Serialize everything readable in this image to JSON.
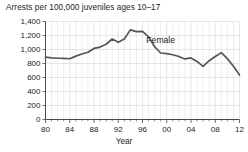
{
  "chart_data": {
    "type": "line",
    "title": "Arrests per 100,000 juveniles ages 10–17",
    "xlabel": "Year",
    "ylabel": "",
    "xlim": [
      1980,
      2012
    ],
    "ylim": [
      0,
      1400
    ],
    "grid": true,
    "legend_position": "inline-annotation",
    "y_ticks": [
      0,
      200,
      400,
      600,
      800,
      1000,
      1200,
      1400
    ],
    "y_tick_labels": [
      "0",
      "200",
      "400",
      "600",
      "800",
      "1,000",
      "1,200",
      "1,400"
    ],
    "x_ticks": [
      1980,
      1984,
      1988,
      1992,
      1996,
      2000,
      2004,
      2008,
      2012
    ],
    "x_tick_labels": [
      "80",
      "84",
      "88",
      "92",
      "96",
      "00",
      "04",
      "08",
      "12"
    ],
    "annotations": [
      {
        "text": "Female",
        "x": 1999,
        "y": 1090
      }
    ],
    "series": [
      {
        "name": "Female",
        "color": "#555555",
        "x": [
          1980,
          1981,
          1982,
          1983,
          1984,
          1985,
          1986,
          1987,
          1988,
          1989,
          1990,
          1991,
          1992,
          1993,
          1994,
          1995,
          1996,
          1997,
          1998,
          1999,
          2000,
          2001,
          2002,
          2003,
          2004,
          2005,
          2006,
          2007,
          2008,
          2009,
          2010,
          2011,
          2012
        ],
        "values": [
          890,
          880,
          875,
          872,
          868,
          905,
          935,
          960,
          1015,
          1035,
          1075,
          1150,
          1105,
          1150,
          1280,
          1255,
          1258,
          1180,
          1040,
          950,
          940,
          925,
          900,
          865,
          880,
          830,
          760,
          840,
          900,
          955,
          870,
          760,
          635
        ]
      }
    ]
  },
  "axis": {
    "x_title": "Year"
  }
}
